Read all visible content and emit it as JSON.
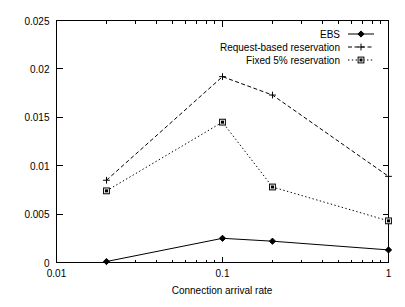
{
  "chart_data": {
    "type": "line",
    "title": "",
    "xlabel": "Connection arrival rate",
    "ylabel": "",
    "xscale": "log",
    "yscale": "linear",
    "xlim": [
      0.01,
      1
    ],
    "ylim": [
      0,
      0.025
    ],
    "grid": false,
    "legend_position": "top-right",
    "xticks": [
      {
        "value": 0.01,
        "label": "0.01"
      },
      {
        "value": 0.1,
        "label": "0.1"
      },
      {
        "value": 1,
        "label": "1"
      }
    ],
    "yticks": [
      {
        "value": 0,
        "label": "0"
      },
      {
        "value": 0.005,
        "label": "0.005"
      },
      {
        "value": 0.01,
        "label": "0.01"
      },
      {
        "value": 0.015,
        "label": "0.015"
      },
      {
        "value": 0.02,
        "label": "0.02"
      },
      {
        "value": 0.025,
        "label": "0.025"
      }
    ],
    "x": [
      0.02,
      0.1,
      0.2,
      1
    ],
    "series": [
      {
        "name": "EBS",
        "marker": "diamond",
        "linestyle": "solid",
        "color": "#000000",
        "values": [
          0.0001,
          0.0025,
          0.0022,
          0.0013
        ]
      },
      {
        "name": "Request-based reservation",
        "marker": "plus",
        "linestyle": "dashed",
        "color": "#000000",
        "values": [
          0.0085,
          0.0192,
          0.0173,
          0.0089
        ]
      },
      {
        "name": "Fixed 5% reservation",
        "marker": "square",
        "linestyle": "dotted",
        "color": "#000000",
        "values": [
          0.0074,
          0.0145,
          0.0078,
          0.0043
        ]
      }
    ]
  },
  "legend": {
    "entries": [
      {
        "label": "EBS"
      },
      {
        "label": "Request-based reservation"
      },
      {
        "label": "Fixed 5% reservation"
      }
    ]
  },
  "axes": {
    "x_title": "Connection arrival rate"
  }
}
